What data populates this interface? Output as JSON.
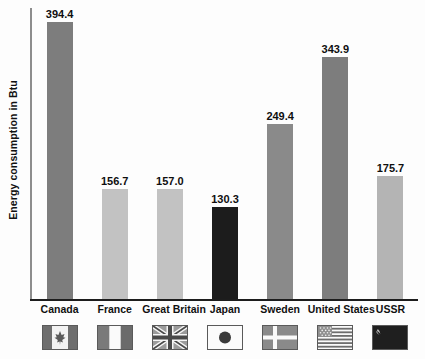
{
  "chart_data": {
    "type": "bar",
    "title": "",
    "xlabel": "",
    "ylabel": "Energy consumption in Btu",
    "categories": [
      "Canada",
      "France",
      "Great Britain",
      "Japan",
      "Sweden",
      "United States",
      "USSR"
    ],
    "values": [
      394.4,
      156.7,
      157.0,
      130.3,
      249.4,
      343.9,
      175.7
    ],
    "value_labels": [
      "394.4",
      "156.7",
      "157.0",
      "130.3",
      "249.4",
      "343.9",
      "175.7"
    ],
    "ylim": [
      0,
      414
    ],
    "grid": false,
    "legend": "none",
    "bar_colors": [
      "#7d7d7d",
      "#c2c2c2",
      "#c2c2c2",
      "#1c1c1c",
      "#8a8a8a",
      "#7d7d7d",
      "#b4b4b4"
    ],
    "axis_color": "#1d1d1d",
    "background": "#fdfdfd"
  },
  "flags": [
    {
      "country": "Canada",
      "icon_name": "flag-canada-icon"
    },
    {
      "country": "France",
      "icon_name": "flag-france-icon"
    },
    {
      "country": "Great Britain",
      "icon_name": "flag-great-britain-icon"
    },
    {
      "country": "Japan",
      "icon_name": "flag-japan-icon"
    },
    {
      "country": "Sweden",
      "icon_name": "flag-sweden-icon"
    },
    {
      "country": "United States",
      "icon_name": "flag-united-states-icon"
    },
    {
      "country": "USSR",
      "icon_name": "flag-ussr-icon"
    }
  ]
}
